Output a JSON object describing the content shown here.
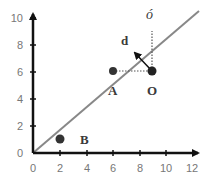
{
  "diagram": {
    "type": "coordinate-geometry",
    "x_axis": {
      "ticks": [
        "0",
        "2",
        "4",
        "6",
        "8",
        "10",
        "12"
      ],
      "range": [
        0,
        12
      ]
    },
    "y_axis": {
      "ticks": [
        "0",
        "2",
        "4",
        "6",
        "8",
        "10"
      ],
      "range": [
        0,
        10
      ]
    },
    "line": {
      "from": [
        0,
        0
      ],
      "to": [
        12.5,
        10.5
      ],
      "color": "#888888"
    },
    "points": [
      {
        "id": "A",
        "label": "A",
        "x": 6,
        "y": 6
      },
      {
        "id": "O",
        "label": "O",
        "x": 9,
        "y": 6
      },
      {
        "id": "B",
        "label": "B",
        "x": 2,
        "y": 1
      }
    ],
    "labels": {
      "o_prime": "ó",
      "distance": "d"
    },
    "colors": {
      "axis": "#111111",
      "point": "#333333",
      "line": "#888888",
      "dotted": "#555555",
      "tick_text": "#777777"
    }
  }
}
